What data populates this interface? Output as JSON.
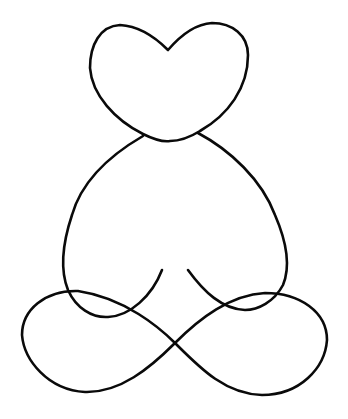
{
  "image": {
    "subject": "line drawing of a seated meditating figure with a heart-shaped head",
    "background_color": "#ffffff",
    "line_color": "#0a0a0a"
  },
  "parts": [
    {
      "name": "heart-head",
      "label": "heart head"
    },
    {
      "name": "torso",
      "label": "torso outline"
    },
    {
      "name": "left-arm",
      "label": "left arm resting on knee"
    },
    {
      "name": "right-arm",
      "label": "right arm resting on knee"
    },
    {
      "name": "crossed-legs",
      "label": "crossed legs (infinity loop)"
    }
  ]
}
